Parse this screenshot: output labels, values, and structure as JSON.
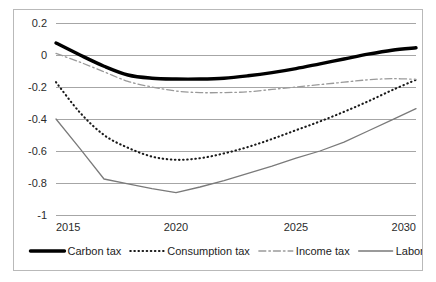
{
  "chart_data": {
    "type": "line",
    "title": "",
    "subtitle": "",
    "xlabel": "",
    "ylabel": "",
    "x": [
      2015,
      2016,
      2017,
      2018,
      2019,
      2020,
      2021,
      2022,
      2023,
      2024,
      2025,
      2026,
      2027,
      2028,
      2029,
      2030
    ],
    "xlim": [
      2015,
      2030
    ],
    "ylim": [
      -1,
      0.2
    ],
    "yticks": [
      0.2,
      0,
      -0.2,
      -0.4,
      -0.6,
      -0.8,
      -1
    ],
    "ytick_labels": [
      "0.2",
      "0",
      "-0.2",
      "-0.4",
      "-0.6",
      "-0.8",
      "-1"
    ],
    "xticks": [
      2015,
      2020,
      2025,
      2030
    ],
    "xtick_labels": [
      "2015",
      "2020",
      "2025",
      "2030"
    ],
    "grid": "horizontal",
    "legend_position": "bottom",
    "series": [
      {
        "name": "Carbon tax",
        "style": "solid-thick",
        "color": "#000000",
        "width": 3.4,
        "dash": "",
        "values": [
          0.075,
          0.0,
          -0.07,
          -0.125,
          -0.145,
          -0.15,
          -0.15,
          -0.145,
          -0.13,
          -0.11,
          -0.085,
          -0.055,
          -0.025,
          0.005,
          0.03,
          0.045
        ]
      },
      {
        "name": "Consumption tax",
        "style": "dotted",
        "color": "#1a1a1a",
        "width": 2.1,
        "dash": "0.5,3.6",
        "values": [
          -0.17,
          -0.36,
          -0.5,
          -0.58,
          -0.635,
          -0.655,
          -0.645,
          -0.615,
          -0.575,
          -0.525,
          -0.47,
          -0.415,
          -0.355,
          -0.29,
          -0.22,
          -0.155
        ]
      },
      {
        "name": "Income tax",
        "style": "dash-dot",
        "color": "#9a9a9a",
        "width": 1.3,
        "dash": "7,3,1.6,3",
        "values": [
          0.01,
          -0.045,
          -0.105,
          -0.165,
          -0.2,
          -0.225,
          -0.235,
          -0.235,
          -0.23,
          -0.215,
          -0.2,
          -0.185,
          -0.17,
          -0.155,
          -0.148,
          -0.152
        ]
      },
      {
        "name": "Labor tax",
        "style": "solid-thin",
        "color": "#7a7a7a",
        "width": 1.3,
        "dash": "",
        "values": [
          -0.4,
          -0.585,
          -0.775,
          -0.805,
          -0.835,
          -0.86,
          -0.825,
          -0.785,
          -0.74,
          -0.695,
          -0.645,
          -0.6,
          -0.545,
          -0.475,
          -0.405,
          -0.335
        ]
      }
    ]
  },
  "legend": {
    "items": [
      {
        "label": "Carbon tax"
      },
      {
        "label": "Consumption tax"
      },
      {
        "label": "Income tax"
      },
      {
        "label": "Labor tax"
      }
    ]
  }
}
